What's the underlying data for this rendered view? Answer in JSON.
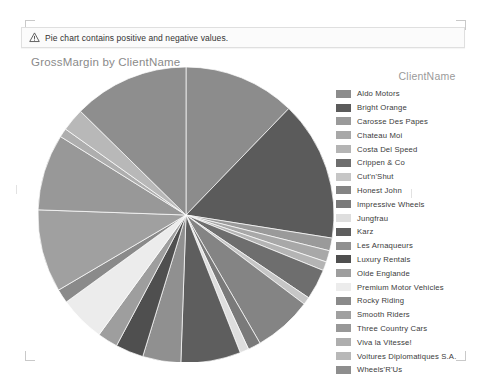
{
  "warning": {
    "icon": "warning-triangle-icon",
    "message": "Pie chart contains positive and negative values."
  },
  "chart": {
    "title": "GrossMargin by ClientName"
  },
  "legend": {
    "title": "ClientName"
  },
  "chart_data": {
    "type": "pie",
    "title": "GrossMargin by ClientName",
    "legend_title": "ClientName",
    "legend_position": "right",
    "start_angle_deg": 0,
    "direction": "clockwise",
    "measure": "GrossMargin",
    "category_field": "ClientName",
    "categories": [
      "Aldo Motors",
      "Bright Orange",
      "Carosse Des Papes",
      "Chateau Moi",
      "Costa Del Speed",
      "Crippen & Co",
      "Cut'n'Shut",
      "Honest John",
      "Impressive Wheels",
      "Jungfrau",
      "Karz",
      "Les Arnaqueurs",
      "Luxury Rentals",
      "Olde Englande",
      "Premium Motor Vehicles",
      "Rocky Riding",
      "Smooth Riders",
      "Three Country Cars",
      "Viva la Vitesse!",
      "Voitures Diplomatiques S.A.",
      "Wheels'R'Us"
    ],
    "values": [
      12.5,
      14.0,
      1.8,
      1.2,
      1.0,
      8.5,
      0.8,
      6.0,
      1.4,
      1.0,
      6.5,
      4.2,
      3.0,
      2.2,
      5.0,
      1.5,
      9.0,
      8.5,
      1.0,
      2.5,
      8.4
    ],
    "colors": [
      "#8c8c8c",
      "#5b5b5b",
      "#9a9a9a",
      "#a8a8a8",
      "#b4b4b4",
      "#6e6e6e",
      "#c6c6c6",
      "#848484",
      "#7a7a7a",
      "#dedede",
      "#5e5e5e",
      "#909090",
      "#4f4f4f",
      "#9e9e9e",
      "#ececec",
      "#8a8a8a",
      "#a0a0a0",
      "#989898",
      "#aeaeae",
      "#b8b8b8",
      "#8e8e8e"
    ],
    "slices": [
      {
        "label": "Aldo Motors",
        "color": "#8c8c8c",
        "start": 0.0,
        "end": 44.0
      },
      {
        "label": "Bright Orange",
        "color": "#5b5b5b",
        "start": 44.0,
        "end": 99.0
      },
      {
        "label": "Carosse Des Papes",
        "color": "#9a9a9a",
        "start": 99.0,
        "end": 104.0
      },
      {
        "label": "Chateau Moi",
        "color": "#a8a8a8",
        "start": 104.0,
        "end": 108.5
      },
      {
        "label": "Costa Del Speed",
        "color": "#b4b4b4",
        "start": 108.5,
        "end": 112.0
      },
      {
        "label": "Crippen & Co",
        "color": "#6e6e6e",
        "start": 112.0,
        "end": 124.0
      },
      {
        "label": "Cut'n'Shut",
        "color": "#c6c6c6",
        "start": 124.0,
        "end": 127.0
      },
      {
        "label": "Honest John",
        "color": "#848484",
        "start": 127.0,
        "end": 150.0
      },
      {
        "label": "Impressive Wheels",
        "color": "#7a7a7a",
        "start": 150.0,
        "end": 155.0
      },
      {
        "label": "Jungfrau",
        "color": "#dedede",
        "start": 155.0,
        "end": 158.5
      },
      {
        "label": "Karz",
        "color": "#5e5e5e",
        "start": 158.5,
        "end": 182.0
      },
      {
        "label": "Les Arnaqueurs",
        "color": "#909090",
        "start": 182.0,
        "end": 197.0
      },
      {
        "label": "Luxury Rentals",
        "color": "#4f4f4f",
        "start": 197.0,
        "end": 208.0
      },
      {
        "label": "Olde Englande",
        "color": "#9e9e9e",
        "start": 208.0,
        "end": 216.0
      },
      {
        "label": "Premium Motor Vehicles",
        "color": "#ececec",
        "start": 216.0,
        "end": 234.0
      },
      {
        "label": "Rocky Riding",
        "color": "#8a8a8a",
        "start": 234.0,
        "end": 239.5
      },
      {
        "label": "Smooth Riders",
        "color": "#a0a0a0",
        "start": 239.5,
        "end": 272.0
      },
      {
        "label": "Three Country Cars",
        "color": "#989898",
        "start": 272.0,
        "end": 302.0
      },
      {
        "label": "Viva la Vitesse!",
        "color": "#aeaeae",
        "start": 302.0,
        "end": 305.5
      },
      {
        "label": "Voitures Diplomatiques S.A.",
        "color": "#b8b8b8",
        "start": 305.5,
        "end": 314.5
      },
      {
        "label": "Wheels'R'Us",
        "color": "#8e8e8e",
        "start": 314.5,
        "end": 360.0
      }
    ]
  },
  "legend_items": [
    {
      "label": "Aldo Motors",
      "color": "#8c8c8c"
    },
    {
      "label": "Bright Orange",
      "color": "#5b5b5b"
    },
    {
      "label": "Carosse Des Papes",
      "color": "#9a9a9a"
    },
    {
      "label": "Chateau Moi",
      "color": "#a8a8a8"
    },
    {
      "label": "Costa Del Speed",
      "color": "#b4b4b4"
    },
    {
      "label": "Crippen & Co",
      "color": "#6e6e6e"
    },
    {
      "label": "Cut'n'Shut",
      "color": "#c6c6c6"
    },
    {
      "label": "Honest John",
      "color": "#848484"
    },
    {
      "label": "Impressive Wheels",
      "color": "#7a7a7a"
    },
    {
      "label": "Jungfrau",
      "color": "#dedede"
    },
    {
      "label": "Karz",
      "color": "#5e5e5e"
    },
    {
      "label": "Les Arnaqueurs",
      "color": "#909090"
    },
    {
      "label": "Luxury Rentals",
      "color": "#4f4f4f"
    },
    {
      "label": "Olde Englande",
      "color": "#9e9e9e"
    },
    {
      "label": "Premium Motor Vehicles",
      "color": "#ececec"
    },
    {
      "label": "Rocky Riding",
      "color": "#8a8a8a"
    },
    {
      "label": "Smooth Riders",
      "color": "#a0a0a0"
    },
    {
      "label": "Three Country Cars",
      "color": "#989898"
    },
    {
      "label": "Viva la Vitesse!",
      "color": "#aeaeae"
    },
    {
      "label": "Voitures Diplomatiques S.A.",
      "color": "#b8b8b8"
    },
    {
      "label": "Wheels'R'Us",
      "color": "#8e8e8e"
    }
  ]
}
